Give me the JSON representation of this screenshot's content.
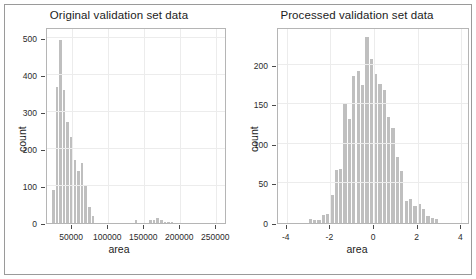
{
  "figure": {
    "background": "#ffffff",
    "frame_color": "#9a9a9a",
    "bar_color": "#bfbfbf",
    "axis_color": "#4a4a4a",
    "grid_color": "#ececec"
  },
  "panels": [
    {
      "key": "original",
      "title": "Original validation set data",
      "xlabel": "area",
      "ylabel": "count"
    },
    {
      "key": "processed",
      "title": "Processed validation set data",
      "xlabel": "area",
      "ylabel": "count"
    }
  ],
  "chart_data": [
    {
      "type": "bar",
      "title": "Original validation set data",
      "xlabel": "area",
      "ylabel": "count",
      "xlim": [
        15000,
        265000
      ],
      "ylim": [
        0,
        530
      ],
      "xticks": [
        50000,
        100000,
        150000,
        200000,
        250000
      ],
      "xtick_labels": [
        "50000",
        "100000",
        "150000",
        "200000",
        "250000"
      ],
      "yticks": [
        0,
        100,
        200,
        300,
        400,
        500
      ],
      "ytick_labels": [
        "0",
        "100",
        "200",
        "300",
        "400",
        "500"
      ],
      "grid": true,
      "legend": "none",
      "bin_width": 5000,
      "bin_starts": [
        22000,
        27000,
        32000,
        37000,
        42000,
        47000,
        52000,
        57000,
        62000,
        67000,
        72000,
        77000,
        82000,
        87000,
        92000,
        97000,
        102000,
        107000,
        112000,
        117000,
        122000,
        127000,
        132000,
        137000,
        142000,
        147000,
        152000,
        157000,
        162000,
        167000,
        172000,
        177000,
        182000,
        187000,
        192000,
        197000,
        202000,
        207000
      ],
      "values": [
        90,
        368,
        495,
        360,
        272,
        232,
        170,
        140,
        163,
        100,
        44,
        18,
        0,
        0,
        0,
        0,
        0,
        0,
        0,
        0,
        0,
        0,
        0,
        7,
        0,
        0,
        0,
        9,
        9,
        14,
        7,
        4,
        4,
        3,
        0,
        0,
        0,
        0
      ]
    },
    {
      "type": "bar",
      "title": "Processed validation set data",
      "xlabel": "area",
      "ylabel": "count",
      "xlim": [
        -4.4,
        4.4
      ],
      "ylim": [
        0,
        248
      ],
      "xticks": [
        -4,
        -2,
        0,
        2,
        4
      ],
      "xtick_labels": [
        "-4",
        "-2",
        "0",
        "2",
        "4"
      ],
      "yticks": [
        0,
        50,
        100,
        150,
        200
      ],
      "ytick_labels": [
        "0",
        "50",
        "100",
        "150",
        "200"
      ],
      "grid": true,
      "legend": "none",
      "bin_width": 0.2,
      "bin_starts": [
        -3.0,
        -2.8,
        -2.6,
        -2.4,
        -2.2,
        -2.0,
        -1.8,
        -1.6,
        -1.4,
        -1.2,
        -1.0,
        -0.8,
        -0.6,
        -0.4,
        -0.2,
        0.0,
        0.2,
        0.4,
        0.6,
        0.8,
        1.0,
        1.2,
        1.4,
        1.6,
        1.8,
        2.0,
        2.2,
        2.4,
        2.6,
        2.8
      ],
      "values": [
        5,
        4,
        4,
        10,
        12,
        35,
        67,
        68,
        150,
        131,
        186,
        192,
        175,
        235,
        207,
        189,
        176,
        168,
        134,
        120,
        83,
        66,
        28,
        30,
        22,
        24,
        18,
        9,
        6,
        5
      ]
    }
  ]
}
